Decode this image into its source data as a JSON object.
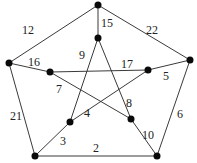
{
  "graph": {
    "type": "weighted-graph",
    "name": "Petersen graph",
    "nodes": [
      {
        "id": "o1",
        "x": 98,
        "y": 5
      },
      {
        "id": "o2",
        "x": 9,
        "y": 63
      },
      {
        "id": "o3",
        "x": 190,
        "y": 60
      },
      {
        "id": "o4",
        "x": 35,
        "y": 156
      },
      {
        "id": "o5",
        "x": 157,
        "y": 156
      },
      {
        "id": "i1",
        "x": 98,
        "y": 38
      },
      {
        "id": "i2",
        "x": 50,
        "y": 72
      },
      {
        "id": "i3",
        "x": 148,
        "y": 70
      },
      {
        "id": "i4",
        "x": 70,
        "y": 122
      },
      {
        "id": "i5",
        "x": 131,
        "y": 119
      }
    ],
    "edges": [
      {
        "from": "o1",
        "to": "o2",
        "weight": "12",
        "lx": 22,
        "ly": 34
      },
      {
        "from": "o1",
        "to": "o3",
        "weight": "22",
        "lx": 146,
        "ly": 34
      },
      {
        "from": "o2",
        "to": "o4",
        "weight": "21",
        "lx": 10,
        "ly": 120
      },
      {
        "from": "o4",
        "to": "o5",
        "weight": "2",
        "lx": 93,
        "ly": 152
      },
      {
        "from": "o3",
        "to": "o5",
        "weight": "6",
        "lx": 177,
        "ly": 118
      },
      {
        "from": "o1",
        "to": "i1",
        "weight": "15",
        "lx": 101,
        "ly": 27
      },
      {
        "from": "o2",
        "to": "i2",
        "weight": "16",
        "lx": 28,
        "ly": 66
      },
      {
        "from": "o3",
        "to": "i3",
        "weight": "5",
        "lx": 163,
        "ly": 80
      },
      {
        "from": "o4",
        "to": "i4",
        "weight": "3",
        "lx": 60,
        "ly": 145
      },
      {
        "from": "o5",
        "to": "i5",
        "weight": "10",
        "lx": 142,
        "ly": 139
      },
      {
        "from": "i1",
        "to": "i4",
        "weight": "9",
        "lx": 79,
        "ly": 59
      },
      {
        "from": "i1",
        "to": "i5",
        "weight": "8",
        "lx": 126,
        "ly": 107
      },
      {
        "from": "i2",
        "to": "i3",
        "weight": "17",
        "lx": 121,
        "ly": 68
      },
      {
        "from": "i2",
        "to": "i5",
        "weight": "7",
        "lx": 56,
        "ly": 93
      },
      {
        "from": "i3",
        "to": "i4",
        "weight": "4",
        "lx": 84,
        "ly": 117
      }
    ]
  }
}
